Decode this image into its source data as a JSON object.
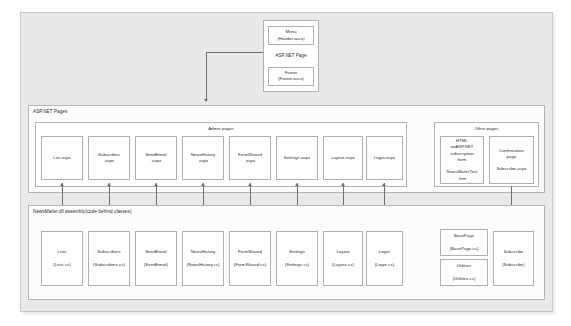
{
  "diagram": {
    "top": {
      "container_label": "ASP.NET Page",
      "menu": "Menu\n(Header.ascx)",
      "footer": "Footer\n(Footer.ascx)"
    },
    "pages_region": {
      "title": "ASP.NET Pages",
      "admin_group": {
        "title": "Admin pages",
        "items": [
          {
            "label": "List.aspx"
          },
          {
            "label": "Subscribes\n.aspx"
          },
          {
            "label": "SendEmail\n.aspx"
          },
          {
            "label": "NewsHistory\n.aspx"
          },
          {
            "label": "FormWizard\n.aspx"
          },
          {
            "label": "Settings.aspx"
          },
          {
            "label": "Layout.aspx"
          },
          {
            "label": "Login.aspx"
          }
        ]
      },
      "other_group": {
        "title": "Other pages",
        "items": [
          {
            "label": "HTML\nonASP.NET\nsubscription\nform\n\nNewsMailerTest\n.htm"
          },
          {
            "label": "Confirmation\npage\n\nSubscribe.aspx"
          }
        ]
      }
    },
    "assembly_region": {
      "title": "NewsMailer.dll assembly(code behind classes)",
      "classes": [
        {
          "label": "Lists\n\n(Lists.cs)"
        },
        {
          "label": "Subscribers\n\n(Subscribers.cs)"
        },
        {
          "label": "SendEmail\n\n(SendEmail)"
        },
        {
          "label": "NewsHistory\n\n(NewsHistory.cs)"
        },
        {
          "label": "FormWizard\n\n(FormWizard.cs)"
        },
        {
          "label": "Settings\n\n(Settings.cs)"
        },
        {
          "label": "Layout\n\n(Layout.cs)"
        },
        {
          "label": "Login\n\n(Login.cs)"
        }
      ],
      "helpers": [
        {
          "label": "BasePage\n\n(BasePage.cs)"
        },
        {
          "label": "Utilities\n\n(Utilities.cs)"
        }
      ],
      "subscribe": {
        "label": "Subscribe\n\n(Subscribe)"
      }
    }
  }
}
